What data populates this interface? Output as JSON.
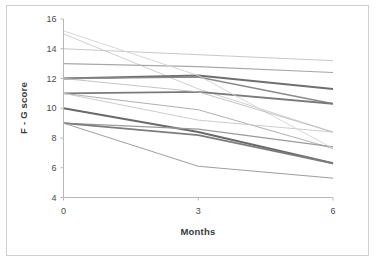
{
  "chart_data": {
    "type": "line",
    "title": "",
    "xlabel": "Months",
    "ylabel": "F - G score",
    "x": [
      0,
      3,
      6
    ],
    "xticklabels": [
      "0",
      "3",
      "6"
    ],
    "yticklabels": [
      "4",
      "6",
      "8",
      "10",
      "12",
      "14",
      "16"
    ],
    "yticks": [
      4,
      6,
      8,
      10,
      12,
      14,
      16
    ],
    "xlim": [
      0,
      6
    ],
    "ylim": [
      4,
      16
    ],
    "grid": false,
    "legend": false,
    "legend_position": "none",
    "series": [
      {
        "name": "subject-1",
        "values": [
          15.0,
          11.3,
          8.4
        ],
        "color": "#c9c9c9",
        "width": 0.9
      },
      {
        "name": "subject-2",
        "values": [
          14.0,
          13.6,
          13.2
        ],
        "color": "#c2c2c2",
        "width": 0.9
      },
      {
        "name": "subject-3",
        "values": [
          13.0,
          12.8,
          12.4
        ],
        "color": "#a8a8a8",
        "width": 1.1
      },
      {
        "name": "subject-4",
        "values": [
          12.0,
          12.2,
          11.3
        ],
        "color": "#6f6f6f",
        "width": 2.0
      },
      {
        "name": "subject-5",
        "values": [
          12.0,
          12.1,
          10.3
        ],
        "color": "#8a8a8a",
        "width": 1.6
      },
      {
        "name": "subject-6",
        "values": [
          11.0,
          11.1,
          10.3
        ],
        "color": "#7a7a7a",
        "width": 1.9
      },
      {
        "name": "subject-7",
        "values": [
          11.0,
          9.9,
          7.3
        ],
        "color": "#b0b0b0",
        "width": 1.0
      },
      {
        "name": "subject-8",
        "values": [
          11.0,
          9.2,
          8.4
        ],
        "color": "#c6c6c6",
        "width": 0.9
      },
      {
        "name": "subject-9",
        "values": [
          10.0,
          8.4,
          6.3
        ],
        "color": "#6a6a6a",
        "width": 2.1
      },
      {
        "name": "subject-10",
        "values": [
          9.0,
          8.6,
          7.4
        ],
        "color": "#9a9a9a",
        "width": 1.2
      },
      {
        "name": "subject-11",
        "values": [
          9.0,
          8.2,
          6.3
        ],
        "color": "#7d7d7d",
        "width": 1.8
      },
      {
        "name": "subject-12",
        "values": [
          9.0,
          6.1,
          5.3
        ],
        "color": "#9e9e9e",
        "width": 1.0
      },
      {
        "name": "subject-13",
        "values": [
          15.2,
          12.2,
          7.3
        ],
        "color": "#d2d2d2",
        "width": 0.9
      },
      {
        "name": "subject-14",
        "values": [
          12.0,
          11.1,
          8.4
        ],
        "color": "#bdbdbd",
        "width": 0.9
      }
    ]
  },
  "axes": {
    "y_title": "F - G score",
    "x_title": "Months"
  }
}
